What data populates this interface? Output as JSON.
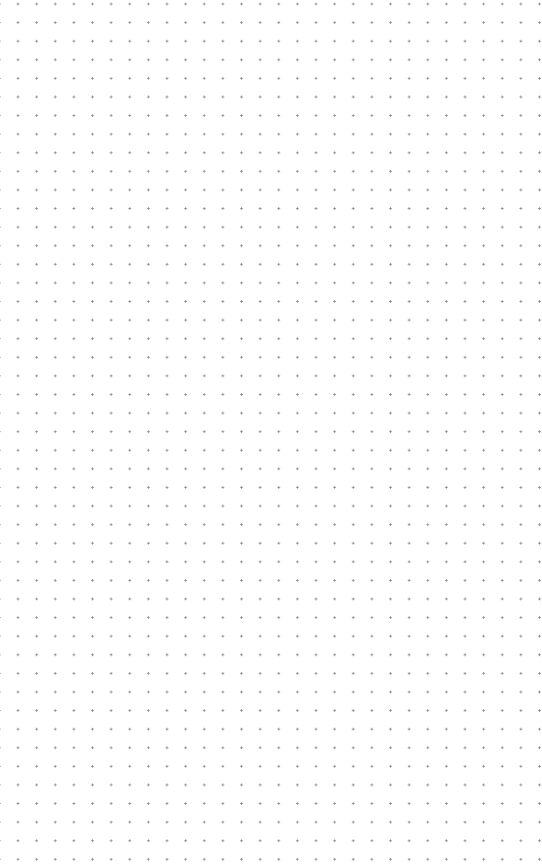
{
  "canvas": {
    "pattern": "dot-grid",
    "background_color": "#ffffff",
    "dot_color": "#8a8a8a",
    "dot_spacing_x": 18.63,
    "dot_spacing_y": 18.6,
    "columns": 28,
    "rows": 46
  }
}
